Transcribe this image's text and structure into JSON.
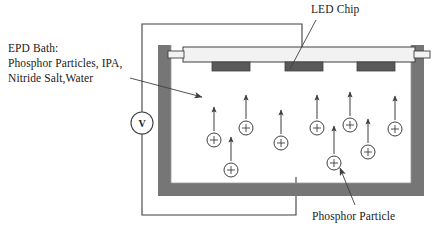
{
  "figure": {
    "type": "schematic-diagram",
    "background_color": "#ffffff",
    "stroke_color": "#3f3f3f",
    "text_color": "#1a1a1a"
  },
  "labels": {
    "epd_bath": {
      "line1": "EPD Bath:",
      "line2": "Phosphor  Particles, IPA,",
      "line3": "Nitride Salt,Water"
    },
    "led_chip": "LED Chip",
    "phosphor_particle": "Phosphor Particle"
  },
  "voltage_source": {
    "symbol": "V",
    "shape": "circle",
    "center_x": 142,
    "center_y": 123,
    "radius": 11
  },
  "container": {
    "name": "epd-bath-vessel",
    "wall_color": "#767676",
    "interior_color": "#ffffff",
    "outer_left": 158,
    "outer_right": 424,
    "outer_top": 45,
    "outer_bottom": 196,
    "wall_thickness": 13
  },
  "electrode_bar": {
    "name": "top-electrode-substrate",
    "fill": "#f2f2f2",
    "stroke": "#3f3f3f",
    "x": 183,
    "y": 47,
    "width": 232,
    "height": 15
  },
  "led_chips": {
    "fill": "#595959",
    "stroke": "#3f3f3f",
    "width": 38,
    "height": 9,
    "items": [
      {
        "x": 212,
        "y": 62
      },
      {
        "x": 285,
        "y": 62
      },
      {
        "x": 357,
        "y": 62
      }
    ]
  },
  "particles": {
    "name": "phosphor-particle",
    "charge_symbol": "+",
    "radius": 7,
    "stroke": "#3f3f3f",
    "arrow_length": 26,
    "items": [
      {
        "cx": 214,
        "cy": 140
      },
      {
        "cx": 246,
        "cy": 128
      },
      {
        "cx": 231,
        "cy": 170
      },
      {
        "cx": 281,
        "cy": 143
      },
      {
        "cx": 317,
        "cy": 128
      },
      {
        "cx": 350,
        "cy": 125
      },
      {
        "cx": 368,
        "cy": 152
      },
      {
        "cx": 395,
        "cy": 129
      },
      {
        "cx": 334,
        "cy": 163
      }
    ]
  },
  "circuit": {
    "name": "dc-power-circuit",
    "stroke": "#3f3f3f",
    "top_wire": "from voltage source up to y=24, right to x=302, down to electrode bar",
    "bottom_wire": "from voltage source down to y=215, right to x=296, up into bath interior"
  },
  "leaders": [
    {
      "name": "epd-bath-leader",
      "from_x": 130,
      "from_y": 78,
      "to_x": 202,
      "to_y": 97
    },
    {
      "name": "led-chip-leader",
      "from_x": 316,
      "from_y": 20,
      "to_x": 290,
      "to_y": 69
    },
    {
      "name": "phosphor-particle-leader",
      "from_x": 355,
      "from_y": 205,
      "to_x": 340,
      "to_y": 168
    }
  ]
}
